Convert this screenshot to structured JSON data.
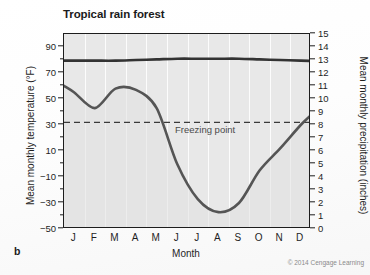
{
  "figure": {
    "panel_letter": "b",
    "credit": "© 2014 Cengage Learning"
  },
  "chart_data": {
    "type": "line",
    "title": "Tropical rain forest",
    "xlabel": "Month",
    "ylabel": "Mean monthly temperature (°F)",
    "ylabel_right": "Mean monthly precipitation (inches)",
    "categories": [
      "J",
      "F",
      "M",
      "A",
      "M",
      "J",
      "J",
      "A",
      "S",
      "O",
      "N",
      "D"
    ],
    "month_names": [
      "January",
      "February",
      "March",
      "April",
      "May",
      "June",
      "July",
      "August",
      "September",
      "October",
      "November",
      "December"
    ],
    "ylim": [
      -50,
      100
    ],
    "yticks": [
      90,
      70,
      50,
      30,
      10,
      -10,
      -30,
      -50
    ],
    "ylim_right": [
      0,
      15
    ],
    "yticks_right": [
      15,
      14,
      13,
      12,
      11,
      10,
      9,
      8,
      7,
      6,
      5,
      4,
      3,
      2,
      1,
      0
    ],
    "grid": "vertical",
    "legend": "none",
    "annotations": [
      {
        "name": "freezing-point",
        "label": "Freezing point",
        "value": 32,
        "axis": "left",
        "style": "dashed-horizontal-line"
      }
    ],
    "series": [
      {
        "name": "Mean monthly temperature",
        "axis": "left",
        "unit": "°F",
        "color": "#333333",
        "values": [
          79.5,
          79.5,
          79.5,
          80.0,
          80.5,
          81.0,
          81.0,
          81.0,
          81.0,
          80.5,
          80.0,
          79.5
        ]
      },
      {
        "name": "Mean monthly precipitation",
        "axis": "right",
        "unit": "inches",
        "color": "#555555",
        "values": [
          10.5,
          9.3,
          10.8,
          10.7,
          9.3,
          5.0,
          2.3,
          1.3,
          2.0,
          4.5,
          6.2,
          8.0
        ]
      }
    ]
  }
}
